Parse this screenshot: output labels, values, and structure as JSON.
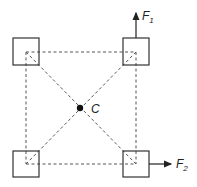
{
  "diagram": {
    "type": "force-diagram",
    "center_label": "C",
    "forces": [
      {
        "name": "F",
        "subscript": "1",
        "direction": "up",
        "from_corner": "top-right"
      },
      {
        "name": "F",
        "subscript": "2",
        "direction": "right",
        "from_corner": "bottom-right"
      }
    ],
    "corners": [
      "top-left",
      "top-right",
      "bottom-left",
      "bottom-right"
    ],
    "colors": {
      "stroke": "#333333",
      "dash": "#555555",
      "background": "#ffffff"
    }
  }
}
